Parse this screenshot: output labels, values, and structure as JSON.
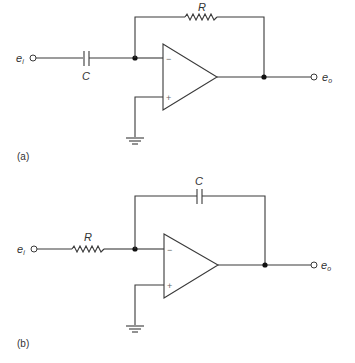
{
  "figure": {
    "panels": [
      {
        "id": "a",
        "caption": "(a)",
        "description": "Op-amp differentiator: input capacitor, feedback resistor",
        "input_label": "e",
        "input_subscript": "i",
        "output_label": "e",
        "output_subscript": "o",
        "input_element": {
          "type": "capacitor",
          "label": "C"
        },
        "feedback_element": {
          "type": "resistor",
          "label": "R"
        },
        "inverting_pin": "−",
        "noninverting_pin": "+",
        "noninverting_connection": "ground"
      },
      {
        "id": "b",
        "caption": "(b)",
        "description": "Op-amp integrator: input resistor, feedback capacitor",
        "input_label": "e",
        "input_subscript": "i",
        "output_label": "e",
        "output_subscript": "o",
        "input_element": {
          "type": "resistor",
          "label": "R"
        },
        "feedback_element": {
          "type": "capacitor",
          "label": "C"
        },
        "inverting_pin": "−",
        "noninverting_pin": "+",
        "noninverting_connection": "ground"
      }
    ]
  },
  "colors": {
    "wire": "#3a3a3a",
    "background": "#ffffff"
  }
}
